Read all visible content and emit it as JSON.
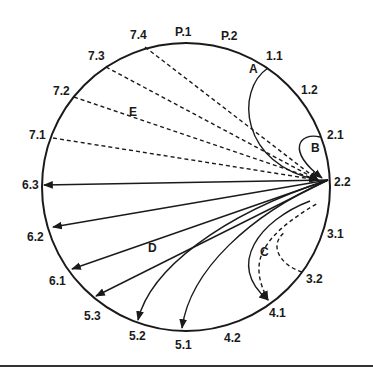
{
  "diagram": {
    "type": "circular pathway diagram",
    "circle": {
      "cx": 186,
      "cy": 187,
      "r": 144
    },
    "hub_label": "2.2",
    "positions": [
      {
        "id": "p1",
        "label": "P.1",
        "x": 196,
        "y": 36
      },
      {
        "id": "p2",
        "label": "P.2",
        "x": 231,
        "y": 38
      },
      {
        "id": "1.1",
        "label": "1.1",
        "x": 271,
        "y": 59
      },
      {
        "id": "1.2",
        "label": "1.2",
        "x": 296,
        "y": 94
      },
      {
        "id": "2.1",
        "label": "2.1",
        "x": 335,
        "y": 137
      },
      {
        "id": "2.2",
        "label": "2.2",
        "x": 335,
        "y": 185
      },
      {
        "id": "3.1",
        "label": "3.1",
        "x": 336,
        "y": 238
      },
      {
        "id": "3.2",
        "label": "3.2",
        "x": 305,
        "y": 285
      },
      {
        "id": "4.1",
        "label": "4.1",
        "x": 274,
        "y": 318
      },
      {
        "id": "4.2",
        "label": "4.2",
        "x": 233,
        "y": 341
      },
      {
        "id": "5.1",
        "label": "5.1",
        "x": 180,
        "y": 349
      },
      {
        "id": "5.2",
        "label": "5.2",
        "x": 137,
        "y": 341
      },
      {
        "id": "5.3",
        "label": "5.3",
        "x": 92,
        "y": 320
      },
      {
        "id": "6.1",
        "label": "6.1",
        "x": 58,
        "y": 283
      },
      {
        "id": "6.2",
        "label": "6.2",
        "x": 34,
        "y": 238
      },
      {
        "id": "6.3",
        "label": "6.3",
        "x": 22,
        "y": 189
      },
      {
        "id": "7.1",
        "label": "7.1",
        "x": 36,
        "y": 139
      },
      {
        "id": "7.2",
        "label": "7.2",
        "x": 60,
        "y": 94
      },
      {
        "id": "7.3",
        "label": "7.3",
        "x": 95,
        "y": 60
      },
      {
        "id": "7.4",
        "label": "7.4",
        "x": 137,
        "y": 40
      }
    ],
    "groups": [
      {
        "id": "A",
        "label": "A",
        "x": 68,
        "y": 68,
        "style": "solid",
        "description": "curved arrow from 1.1 to 2.2"
      },
      {
        "id": "B",
        "label": "B",
        "x": 128,
        "y": 148,
        "style": "solid",
        "description": "loop arrow from 2.1 to 2.2"
      },
      {
        "id": "C",
        "label": "C",
        "x": 79,
        "y": 266,
        "style": "solid+dashed",
        "description": "arrows between 2.2, 4.1 and 3.2"
      },
      {
        "id": "D",
        "label": "D",
        "x": 153,
        "y": 246,
        "style": "solid",
        "description": "fan of arrows from 2.2 to 6.3, 6.2, 6.1, 5.3, 5.2, 5.1"
      },
      {
        "id": "E",
        "label": "E",
        "x": 133,
        "y": 110,
        "style": "dashed",
        "description": "dashed arrows from 7.1–7.4 to 2.2"
      }
    ],
    "group_labels": {
      "A": "A",
      "B": "B",
      "C": "C",
      "D": "D",
      "E": "E"
    }
  }
}
